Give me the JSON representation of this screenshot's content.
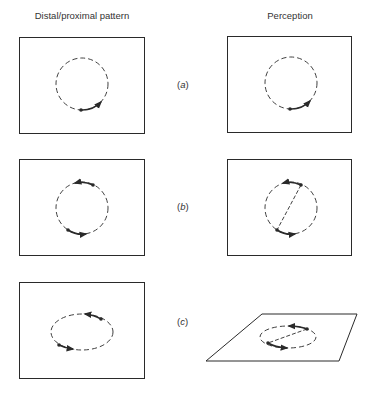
{
  "header": {
    "left_title": "Distal/proximal pattern",
    "right_title": "Perception"
  },
  "rows": [
    {
      "label_open": "(",
      "label_letter": "a",
      "label_close": ")",
      "description": "Single dot rotating on circle; perceived as rotation on circle"
    },
    {
      "label_open": "(",
      "label_letter": "b",
      "label_close": ")",
      "description": "Two opposite dots rotating on circle; perceived as rotating bar"
    },
    {
      "label_open": "(",
      "label_letter": "c",
      "label_close": ")",
      "description": "Two dots on ellipse; perceived as rotating bar on tilted plane"
    }
  ],
  "colors": {
    "stroke": "#2a2a2a",
    "background": "#ffffff"
  }
}
